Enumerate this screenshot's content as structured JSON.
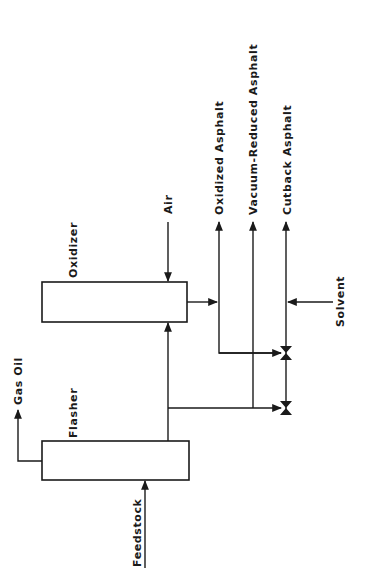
{
  "diagram": {
    "type": "process-flow",
    "units": [
      {
        "id": "flasher",
        "label": "Flasher"
      },
      {
        "id": "oxidizer",
        "label": "Oxidizer"
      }
    ],
    "streams": {
      "feedstock": "Feedstock",
      "gas_oil": "Gas Oil",
      "air": "Air",
      "solvent": "Solvent",
      "oxidized_asphalt": "Oxidized Asphalt",
      "vacuum_reduced_asphalt": "Vacuum-Reduced Asphalt",
      "cutback_asphalt": "Cutback Asphalt"
    },
    "valves": [
      {
        "id": "valve-upper",
        "icon": "valve-icon"
      },
      {
        "id": "valve-lower",
        "icon": "valve-icon"
      }
    ],
    "colors": {
      "line": "#1a1a1a",
      "background": "#ffffff"
    }
  }
}
